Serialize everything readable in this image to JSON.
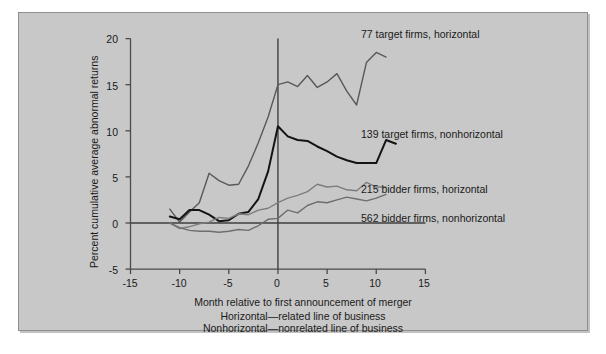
{
  "figure": {
    "background_color": "#c8c8c8",
    "page_color": "#ffffff",
    "text_color": "#1a1a1a"
  },
  "axes": {
    "y_title": "Percent cumulative average abnormal returns",
    "x_title": "Month relative to first announcement of merger",
    "y_ticks": [
      "20",
      "15",
      "10",
      "5",
      "0",
      "-5"
    ],
    "x_ticks": [
      "-15",
      "-10",
      "-5",
      "0",
      "5",
      "10",
      "15"
    ]
  },
  "captions": {
    "line1": "Horizontal—related line of business",
    "line2": "Nonhorizontal—nonrelated line of business"
  },
  "series_labels": {
    "target_horizontal": "77 target firms, horizontal",
    "target_nonhorizontal": "139 target firms, nonhorizontal",
    "bidder_horizontal": "215 bidder firms, horizontal",
    "bidder_nonhorizontal": "562 bidder firms, nonhorizontal"
  },
  "chart_data": {
    "type": "line",
    "title": "",
    "xlabel": "Month relative to first announcement of merger",
    "ylabel": "Percent cumulative average abnormal returns",
    "xlim": [
      -16,
      16
    ],
    "ylim": [
      -5,
      20
    ],
    "xticks": [
      -15,
      -10,
      -5,
      0,
      5,
      10,
      15
    ],
    "yticks": [
      -5,
      0,
      5,
      10,
      15,
      20
    ],
    "grid": false,
    "legend_position": "inline-right-annotations",
    "annotations": [
      {
        "text": "77 target firms, horizontal",
        "x": 4.0,
        "y": 19.2
      },
      {
        "text": "139 target firms, nonhorizontal",
        "x": 4.0,
        "y": 11.2
      },
      {
        "text": "215 bidder firms, horizontal",
        "x": 4.0,
        "y": 5.1
      },
      {
        "text": "562 bidder firms, nonhorizontal",
        "x": 4.0,
        "y": 1.7
      }
    ],
    "reference_lines": [
      {
        "axis": "y",
        "value": 0,
        "style": "solid"
      },
      {
        "axis": "x",
        "value": 0,
        "style": "solid"
      }
    ],
    "x": [
      -11,
      -10,
      -9,
      -8,
      -7,
      -6,
      -5,
      -4,
      -3,
      -2,
      -1,
      0,
      1,
      2,
      3,
      4,
      5,
      6,
      7,
      8,
      9,
      10,
      11,
      12
    ],
    "series": [
      {
        "name": "77 target firms, horizontal",
        "color": "#595959",
        "width": 1.4,
        "values": [
          1.5,
          0.1,
          1.2,
          2.2,
          5.4,
          4.6,
          4.1,
          4.2,
          6.2,
          8.7,
          11.5,
          15.0,
          15.3,
          14.8,
          16.0,
          14.7,
          15.3,
          16.2,
          14.3,
          12.8,
          17.4,
          18.5,
          18.0,
          null
        ]
      },
      {
        "name": "139 target firms, nonhorizontal",
        "color": "#141414",
        "width": 2.0,
        "values": [
          0.7,
          0.4,
          1.4,
          1.4,
          0.9,
          0.2,
          0.3,
          1.0,
          1.2,
          2.6,
          5.6,
          10.5,
          9.4,
          9.0,
          8.9,
          8.3,
          7.8,
          7.2,
          6.8,
          6.5,
          6.5,
          6.5,
          9.0,
          8.6
        ]
      },
      {
        "name": "215 bidder firms, horizontal",
        "color": "#7d7d7d",
        "width": 1.4,
        "values": [
          0.0,
          -0.6,
          -0.4,
          -0.1,
          0.1,
          0.6,
          0.5,
          1.0,
          0.9,
          1.4,
          1.6,
          2.2,
          2.7,
          3.0,
          3.4,
          4.2,
          3.9,
          4.0,
          3.6,
          3.5,
          4.4,
          3.9,
          3.9,
          null
        ]
      },
      {
        "name": "562 bidder firms, nonhorizontal",
        "color": "#6e6e6e",
        "width": 1.4,
        "values": [
          0.0,
          -0.5,
          -0.8,
          -0.9,
          -0.9,
          -1.0,
          -0.9,
          -0.7,
          -0.8,
          -0.3,
          0.4,
          0.5,
          1.4,
          1.1,
          1.9,
          2.3,
          2.2,
          2.5,
          2.8,
          2.6,
          2.4,
          2.7,
          3.1,
          null
        ]
      }
    ]
  }
}
